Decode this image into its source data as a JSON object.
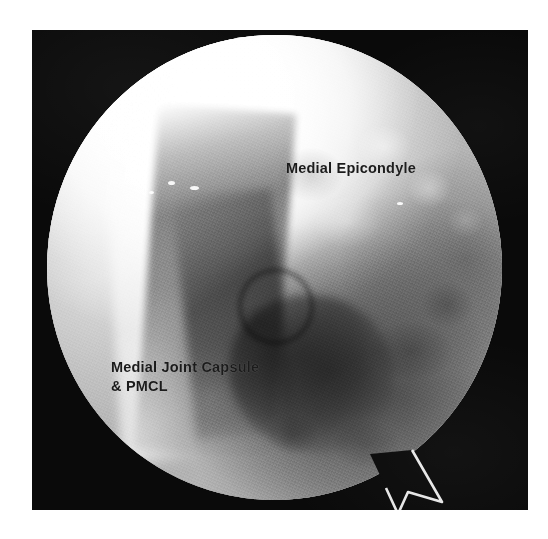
{
  "image": {
    "kind": "arthroscopic-photograph",
    "modality": "arthroscopy",
    "view_shape": "circular-scope-aperture",
    "frame_color": "#0a0a0a",
    "page_color": "#ffffff",
    "rim_color": "#ffffff",
    "annotation_color": "#1b1b1b"
  },
  "annotations": [
    {
      "id": "medial-epicondyle",
      "text": "Medial Epicondyle",
      "position": "upper-right",
      "lines": [
        "Medial Epicondyle"
      ]
    },
    {
      "id": "medial-joint-capsule-pmcl",
      "text": "Medial Joint Capsule\n& PMCL",
      "position": "lower-left",
      "lines": [
        "Medial Joint Capsule",
        "& PMCL"
      ]
    }
  ],
  "features": {
    "bright_region": "Medial Epicondyle bone surface, over-exposed upper-left/upper-centre",
    "dark_region": "Shadowed soft-tissue recess, lower-right quadrant",
    "fissure": "Dark diagonal joint-line crevice running upper-left to lower-right",
    "notch": "V-shaped scope aperture artifact at lower-right rim"
  }
}
